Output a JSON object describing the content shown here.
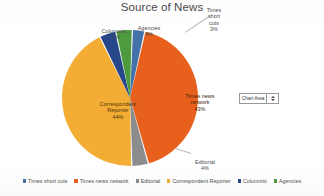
{
  "chart": {
    "title": "Source of News"
  },
  "chart_data": {
    "type": "pie",
    "title": "Source of News",
    "xlabel": "",
    "ylabel": "",
    "legend_position": "bottom",
    "grid": false,
    "categories": [
      "Times short cuts",
      "Times news network",
      "Editorial",
      "Correspondent Reporter",
      "Columnist",
      "Agencies"
    ],
    "values": [
      3,
      43,
      4,
      44,
      4,
      4
    ],
    "value_labels": [
      "3%",
      "43%",
      "4%",
      "44%",
      "4%",
      "4%"
    ],
    "colors": [
      "#4472a8",
      "#e8611c",
      "#8c8c8c",
      "#f3ad34",
      "#27478a",
      "#4e9a3f"
    ],
    "slice_labels": [
      {
        "name": "Times short cuts",
        "text": "Times\nshort\ncuts",
        "pct": "3%",
        "placement": "outside"
      },
      {
        "name": "Agencies",
        "text": "Agencies",
        "pct": "4%",
        "placement": "outside"
      },
      {
        "name": "Columnist",
        "text": "Columnist...",
        "pct": "4%",
        "placement": "outside"
      },
      {
        "name": "Times news network",
        "text": "Times news\nnetwork",
        "pct": "43%",
        "placement": "inside"
      },
      {
        "name": "Correspondent Reporter",
        "text": "Correspondent\nReporter",
        "pct": "44%",
        "placement": "inside"
      },
      {
        "name": "Editorial",
        "text": "Editorial",
        "pct": "4%",
        "placement": "outside"
      }
    ]
  },
  "legend": {
    "items": [
      {
        "label": "Times short cuts",
        "color": "#4472a8"
      },
      {
        "label": "Times news network",
        "color": "#e8611c"
      },
      {
        "label": "Editorial",
        "color": "#8c8c8c"
      },
      {
        "label": "Correspondent Reporter",
        "color": "#f3ad34"
      },
      {
        "label": "Columnist",
        "color": "#27478a"
      },
      {
        "label": "Agencies",
        "color": "#4e9a3f"
      }
    ]
  },
  "chart_area_tooltip": {
    "label": "Chart Area",
    "up_icon": "caret-up-icon",
    "down_icon": "caret-down-icon"
  }
}
